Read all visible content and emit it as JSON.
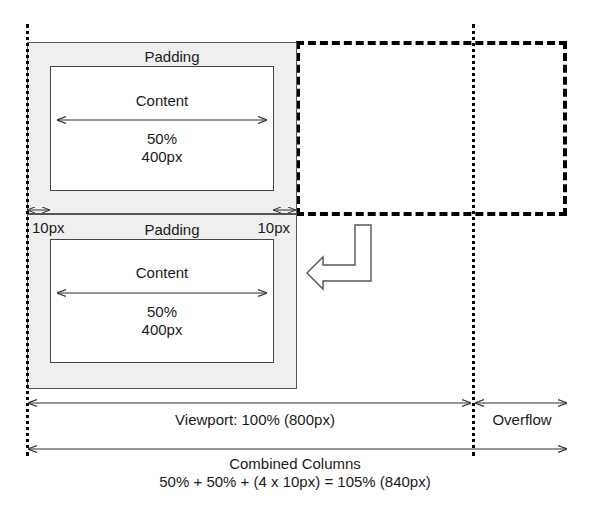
{
  "diagram": {
    "top_box": {
      "padding_label": "Padding",
      "content_label": "Content",
      "width_percent": "50%",
      "width_px": "400px"
    },
    "bottom_box": {
      "padding_label": "Padding",
      "content_label": "Content",
      "width_percent": "50%",
      "width_px": "400px",
      "left_padding_label": "10px",
      "right_padding_label": "10px"
    },
    "viewport_label": "Viewport: 100% (800px)",
    "overflow_label": "Overflow",
    "combined_title": "Combined Columns",
    "combined_formula": "50% + 50% + (4 x 10px) = 105% (840px)",
    "colors": {
      "padding_fill": "#efefef",
      "border": "#444444",
      "line": "#000000"
    }
  }
}
